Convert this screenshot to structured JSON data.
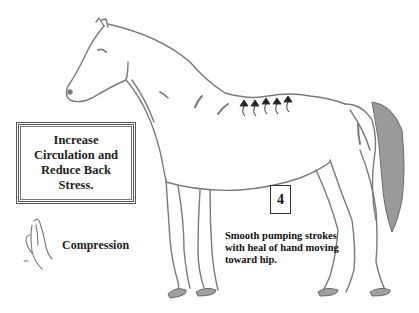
{
  "diagram": {
    "goal_box": {
      "text": "Increase Circulation and Reduce Back Stress."
    },
    "step": {
      "number": "4"
    },
    "instructions": "Smooth pumping strokes with heal of hand moving toward hip.",
    "technique": {
      "icon": "hand-icon",
      "label": "Compression"
    },
    "stroke_arrows": {
      "count": 5,
      "direction": "up",
      "location": "back"
    },
    "colors": {
      "outline": "#7a7a7a",
      "tail_fill": "#9a9a9a",
      "hoof_fill": "#a0a0a0",
      "text": "#111111"
    }
  }
}
